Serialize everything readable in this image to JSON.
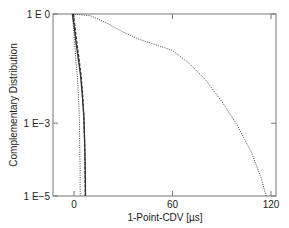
{
  "chart_data": {
    "type": "line",
    "title": "",
    "xlabel": "1-Point-CDV [µs]",
    "ylabel": "Complementary Distribution",
    "xlim": [
      -13,
      122
    ],
    "ylim_log10": [
      -5,
      0
    ],
    "yscale": "log",
    "grid": false,
    "legend": null,
    "x_ticks": [
      0,
      60,
      120
    ],
    "x_tick_labels": [
      "0",
      "60",
      "120"
    ],
    "y_ticks_log10": [
      0,
      -3,
      -5
    ],
    "y_tick_labels": [
      "1 E 0",
      "1 E−3",
      "1 E−5"
    ],
    "series": [
      {
        "name": "dotted-wide",
        "style": "dotted",
        "points": [
          [
            -1,
            0
          ],
          [
            10,
            -0.05
          ],
          [
            20,
            -0.25
          ],
          [
            30,
            -0.5
          ],
          [
            40,
            -0.7
          ],
          [
            50,
            -0.85
          ],
          [
            60,
            -1.0
          ],
          [
            70,
            -1.35
          ],
          [
            80,
            -1.8
          ],
          [
            90,
            -2.4
          ],
          [
            100,
            -3.1
          ],
          [
            108,
            -3.8
          ],
          [
            114,
            -4.5
          ],
          [
            117,
            -5.0
          ]
        ]
      },
      {
        "name": "solid",
        "style": "solid",
        "points": [
          [
            -1,
            0
          ],
          [
            0,
            -0.3
          ],
          [
            1,
            -0.7
          ],
          [
            2.5,
            -1.2
          ],
          [
            4,
            -1.7
          ],
          [
            5,
            -2.2
          ],
          [
            6,
            -2.8
          ],
          [
            6.5,
            -3.5
          ],
          [
            6.8,
            -4.2
          ],
          [
            7,
            -5.0
          ]
        ]
      },
      {
        "name": "dashed",
        "style": "dashed",
        "points": [
          [
            -0.5,
            0
          ],
          [
            0.5,
            -0.3
          ],
          [
            1.5,
            -0.7
          ],
          [
            3,
            -1.2
          ],
          [
            4.3,
            -1.7
          ],
          [
            5.3,
            -2.2
          ],
          [
            6,
            -2.8
          ],
          [
            6.4,
            -3.5
          ],
          [
            6.7,
            -4.2
          ],
          [
            6.9,
            -5.0
          ]
        ]
      },
      {
        "name": "dotted-narrow",
        "style": "dotted",
        "points": [
          [
            -1,
            0
          ],
          [
            -0.5,
            -0.3
          ],
          [
            0.2,
            -0.7
          ],
          [
            1,
            -1.2
          ],
          [
            2,
            -1.7
          ],
          [
            2.7,
            -2.2
          ],
          [
            3.2,
            -2.8
          ],
          [
            3.5,
            -3.5
          ],
          [
            3.7,
            -4.2
          ],
          [
            3.8,
            -5.0
          ]
        ]
      }
    ]
  }
}
